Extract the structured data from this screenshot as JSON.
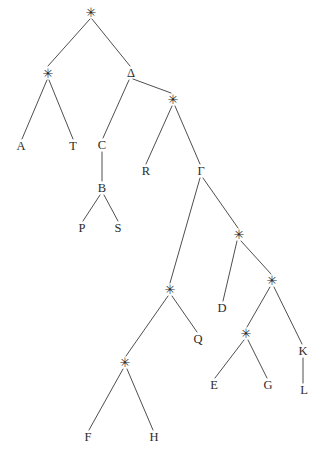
{
  "figure": {
    "kind": "binary-tree-diagram",
    "background_color": "#ffffff",
    "stroke_color": "#3a3a3a",
    "text_color": "#2b2b2b",
    "width": 323,
    "height": 453,
    "star_glyph": "✳"
  },
  "nodes": [
    {
      "id": "n-root",
      "label": "✳",
      "type": "star",
      "x": 91,
      "y": 12
    },
    {
      "id": "n-starL",
      "label": "✳",
      "type": "star",
      "x": 48,
      "y": 73
    },
    {
      "id": "n-delta",
      "label": "Δ",
      "type": "named",
      "x": 131,
      "y": 73
    },
    {
      "id": "n-A",
      "label": "A",
      "type": "leaf",
      "x": 21,
      "y": 146
    },
    {
      "id": "n-T",
      "label": "T",
      "type": "leaf",
      "x": 73,
      "y": 146
    },
    {
      "id": "n-C",
      "label": "C",
      "type": "named",
      "x": 102,
      "y": 145
    },
    {
      "id": "n-star2",
      "label": "✳",
      "type": "star",
      "x": 173,
      "y": 99
    },
    {
      "id": "n-B",
      "label": "B",
      "type": "named",
      "x": 102,
      "y": 188
    },
    {
      "id": "n-P",
      "label": "P",
      "type": "leaf",
      "x": 82,
      "y": 228
    },
    {
      "id": "n-S",
      "label": "S",
      "type": "leaf",
      "x": 118,
      "y": 228
    },
    {
      "id": "n-R",
      "label": "R",
      "type": "leaf",
      "x": 146,
      "y": 171
    },
    {
      "id": "n-gamma",
      "label": "Γ",
      "type": "named",
      "x": 201,
      "y": 171
    },
    {
      "id": "n-star3",
      "label": "✳",
      "type": "star",
      "x": 170,
      "y": 289
    },
    {
      "id": "n-star4",
      "label": "✳",
      "type": "star",
      "x": 239,
      "y": 234
    },
    {
      "id": "n-Q",
      "label": "Q",
      "type": "leaf",
      "x": 198,
      "y": 339
    },
    {
      "id": "n-star5",
      "label": "✳",
      "type": "star",
      "x": 125,
      "y": 362
    },
    {
      "id": "n-D",
      "label": "D",
      "type": "leaf",
      "x": 222,
      "y": 308
    },
    {
      "id": "n-star6",
      "label": "✳",
      "type": "star",
      "x": 272,
      "y": 280
    },
    {
      "id": "n-star7",
      "label": "✳",
      "type": "star",
      "x": 246,
      "y": 333
    },
    {
      "id": "n-K",
      "label": "K",
      "type": "named",
      "x": 303,
      "y": 351
    },
    {
      "id": "n-E",
      "label": "E",
      "type": "leaf",
      "x": 214,
      "y": 385
    },
    {
      "id": "n-G",
      "label": "G",
      "type": "leaf",
      "x": 268,
      "y": 385
    },
    {
      "id": "n-L",
      "label": "L",
      "type": "leaf",
      "x": 304,
      "y": 390
    },
    {
      "id": "n-F",
      "label": "F",
      "type": "leaf",
      "x": 88,
      "y": 437
    },
    {
      "id": "n-H",
      "label": "H",
      "type": "leaf",
      "x": 154,
      "y": 437
    }
  ],
  "edges": [
    {
      "from": "n-root",
      "to": "n-starL",
      "x1": 90,
      "y1": 19,
      "x2": 48,
      "y2": 66
    },
    {
      "from": "n-root",
      "to": "n-delta",
      "x1": 92,
      "y1": 19,
      "x2": 130,
      "y2": 66
    },
    {
      "from": "n-starL",
      "to": "n-A",
      "x1": 47,
      "y1": 80,
      "x2": 22,
      "y2": 139
    },
    {
      "from": "n-starL",
      "to": "n-T",
      "x1": 49,
      "y1": 80,
      "x2": 73,
      "y2": 139
    },
    {
      "from": "n-delta",
      "to": "n-C",
      "x1": 129,
      "y1": 80,
      "x2": 103,
      "y2": 138
    },
    {
      "from": "n-delta",
      "to": "n-star2",
      "x1": 133,
      "y1": 79,
      "x2": 171,
      "y2": 93
    },
    {
      "from": "n-C",
      "to": "n-B",
      "x1": 102,
      "y1": 152,
      "x2": 102,
      "y2": 181
    },
    {
      "from": "n-B",
      "to": "n-P",
      "x1": 100,
      "y1": 195,
      "x2": 83,
      "y2": 221
    },
    {
      "from": "n-B",
      "to": "n-S",
      "x1": 104,
      "y1": 195,
      "x2": 118,
      "y2": 221
    },
    {
      "from": "n-star2",
      "to": "n-R",
      "x1": 172,
      "y1": 106,
      "x2": 146,
      "y2": 164
    },
    {
      "from": "n-star2",
      "to": "n-gamma",
      "x1": 175,
      "y1": 106,
      "x2": 200,
      "y2": 164
    },
    {
      "from": "n-gamma",
      "to": "n-star3",
      "x1": 200,
      "y1": 178,
      "x2": 170,
      "y2": 283
    },
    {
      "from": "n-gamma",
      "to": "n-star4",
      "x1": 203,
      "y1": 178,
      "x2": 238,
      "y2": 228
    },
    {
      "from": "n-star3",
      "to": "n-star5",
      "x1": 168,
      "y1": 296,
      "x2": 126,
      "y2": 356
    },
    {
      "from": "n-star3",
      "to": "n-Q",
      "x1": 172,
      "y1": 296,
      "x2": 197,
      "y2": 332
    },
    {
      "from": "n-star5",
      "to": "n-F",
      "x1": 123,
      "y1": 369,
      "x2": 89,
      "y2": 430
    },
    {
      "from": "n-star5",
      "to": "n-H",
      "x1": 127,
      "y1": 369,
      "x2": 153,
      "y2": 430
    },
    {
      "from": "n-star4",
      "to": "n-D",
      "x1": 237,
      "y1": 241,
      "x2": 223,
      "y2": 301
    },
    {
      "from": "n-star4",
      "to": "n-star6",
      "x1": 241,
      "y1": 241,
      "x2": 271,
      "y2": 274
    },
    {
      "from": "n-star6",
      "to": "n-star7",
      "x1": 270,
      "y1": 287,
      "x2": 247,
      "y2": 327
    },
    {
      "from": "n-star6",
      "to": "n-K",
      "x1": 274,
      "y1": 287,
      "x2": 302,
      "y2": 344
    },
    {
      "from": "n-star7",
      "to": "n-E",
      "x1": 244,
      "y1": 340,
      "x2": 215,
      "y2": 378
    },
    {
      "from": "n-star7",
      "to": "n-G",
      "x1": 248,
      "y1": 340,
      "x2": 267,
      "y2": 378
    },
    {
      "from": "n-K",
      "to": "n-L",
      "x1": 303,
      "y1": 358,
      "x2": 303,
      "y2": 383
    }
  ]
}
